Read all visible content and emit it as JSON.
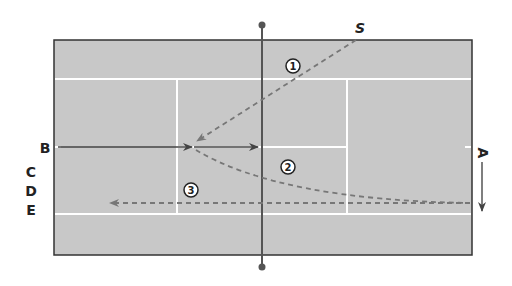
{
  "diagram": {
    "type": "tennis-court-drill",
    "orientation": "horizontal",
    "colors": {
      "court_fill": "#c8c8c8",
      "court_border": "#333333",
      "court_lines": "#ffffff",
      "net": "#555555",
      "solid_path": "#444444",
      "dashed_path": "#777777",
      "text": "#222222"
    },
    "player_labels": {
      "S": "S",
      "A": "A",
      "B": "B",
      "C": "C",
      "D": "D",
      "E": "E"
    },
    "shot_numbers": [
      "1",
      "2",
      "3"
    ],
    "paths": [
      {
        "id": "shot-1",
        "style": "dashed",
        "from": "S",
        "to": "service-box-left",
        "number": "1"
      },
      {
        "id": "shot-2",
        "style": "dashed",
        "from": "service-box-left",
        "to": "A",
        "number": "2"
      },
      {
        "id": "shot-3",
        "style": "dashed",
        "from": "A",
        "to": "left-baseline",
        "number": "3"
      },
      {
        "id": "player-b-move-1",
        "style": "solid",
        "from": "B",
        "to": "service-line"
      },
      {
        "id": "player-b-move-2",
        "style": "solid",
        "from": "service-line",
        "to": "net"
      },
      {
        "id": "player-a-move",
        "style": "solid",
        "from": "A",
        "to": "down"
      }
    ]
  }
}
